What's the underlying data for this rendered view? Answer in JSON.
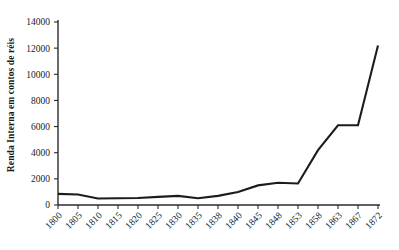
{
  "chart_data": {
    "type": "line",
    "title": "",
    "xlabel": "",
    "ylabel": "Renda Interna em contos de réis",
    "categories": [
      "1800",
      "1805",
      "1810",
      "1815",
      "1820",
      "1825",
      "1830",
      "1835",
      "1838",
      "1840",
      "1845",
      "1848",
      "1853",
      "1858",
      "1863",
      "1867",
      "1872"
    ],
    "values": [
      850,
      800,
      500,
      520,
      540,
      620,
      700,
      520,
      700,
      1000,
      1500,
      1700,
      1650,
      4200,
      6100,
      6100,
      12200
    ],
    "series": [
      {
        "name": "Renda Interna",
        "values": [
          850,
          800,
          500,
          520,
          540,
          620,
          700,
          520,
          700,
          1000,
          1500,
          1700,
          1650,
          4200,
          6100,
          6100,
          12200
        ]
      }
    ],
    "ylim": [
      0,
      14000
    ],
    "yticks": [
      0,
      2000,
      4000,
      6000,
      8000,
      10000,
      12000,
      14000
    ],
    "ytick_labels": [
      "0",
      "2000",
      "4000",
      "6000",
      "8000",
      "10000",
      "12000",
      "14000"
    ],
    "grid": false,
    "legend": false,
    "legend_position": "none",
    "line_color": "#1c1c1c",
    "axis_color": "#2b2b2b",
    "background_color": "#ffffff",
    "xtick_rotation": -45
  }
}
